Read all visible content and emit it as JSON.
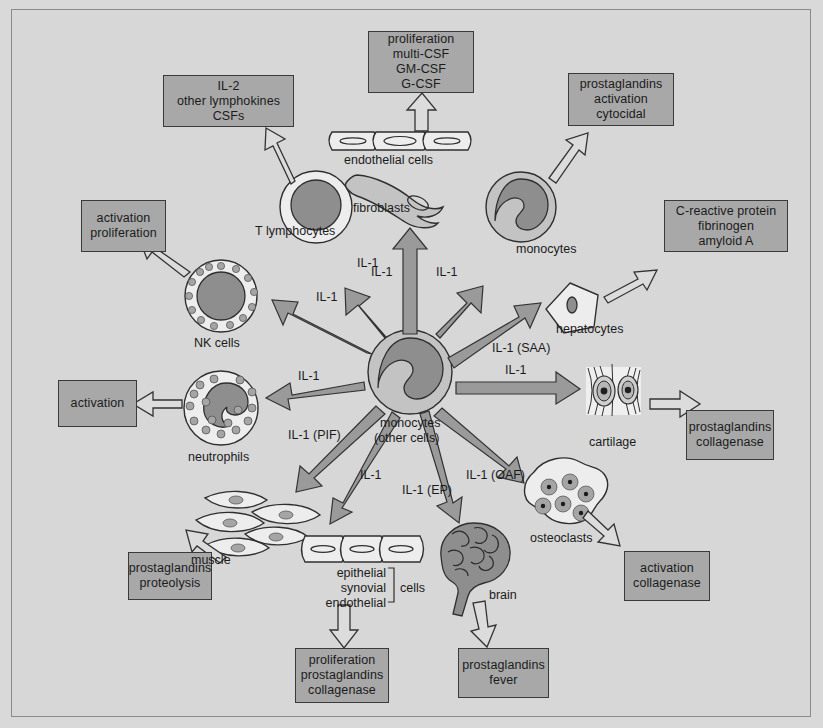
{
  "diagram": {
    "center": {
      "name": "monocytes-center",
      "label_line1": "monocytes",
      "label_line2": "(other cells)"
    },
    "colors": {
      "background": "#d7d7d7",
      "box_fill": "#a8a8a8",
      "box_border": "#3a3a3a",
      "solid_arrow": "#9a9a9a",
      "open_arrow": "#dcdcdc",
      "nucleus": "#8e8e8e",
      "cell_light": "#ededed",
      "text": "#1b1b1b"
    },
    "boxes": [
      {
        "name": "box-proliferation-csf",
        "lines": [
          "proliferation",
          "multi-CSF",
          "GM-CSF",
          "G-CSF"
        ]
      },
      {
        "name": "box-il2-lymphokines",
        "lines": [
          "IL-2",
          "other lymphokines",
          "CSFs"
        ]
      },
      {
        "name": "box-prostaglandins-activation-cytocidal",
        "lines": [
          "prostaglandins",
          "activation",
          "cytocidal"
        ]
      },
      {
        "name": "box-acute-phase-proteins",
        "lines": [
          "C-reactive protein",
          "fibrinogen",
          "amyloid A"
        ]
      },
      {
        "name": "box-activation-proliferation",
        "lines": [
          "activation",
          "proliferation"
        ]
      },
      {
        "name": "box-activation",
        "lines": [
          "activation"
        ]
      },
      {
        "name": "box-prostaglandins-proteolysis",
        "lines": [
          "prostaglandins",
          "proteolysis"
        ]
      },
      {
        "name": "box-proliferation-prostaglandins-collagenase",
        "lines": [
          "proliferation",
          "prostaglandins",
          "collagenase"
        ]
      },
      {
        "name": "box-prostaglandins-fever",
        "lines": [
          "prostaglandins",
          "fever"
        ]
      },
      {
        "name": "box-activation-collagenase",
        "lines": [
          "activation",
          "collagenase"
        ]
      },
      {
        "name": "box-prostaglandins-collagenase",
        "lines": [
          "prostaglandins",
          "collagenase"
        ]
      }
    ],
    "cells": [
      {
        "name": "cell-label-endothelial-cells",
        "label": "endothelial cells"
      },
      {
        "name": "cell-label-fibroblasts",
        "label": "fibroblasts"
      },
      {
        "name": "cell-label-t-lymphocytes",
        "label": "T lymphocytes"
      },
      {
        "name": "cell-label-monocytes",
        "label": "monocytes"
      },
      {
        "name": "cell-label-hepatocytes",
        "label": "hepatocytes"
      },
      {
        "name": "cell-label-nk-cells",
        "label": "NK cells"
      },
      {
        "name": "cell-label-neutrophils",
        "label": "neutrophils"
      },
      {
        "name": "cell-label-muscle",
        "label": "muscle"
      },
      {
        "name": "cell-label-cartilage",
        "label": "cartilage"
      },
      {
        "name": "cell-label-osteoclasts",
        "label": "osteoclasts"
      },
      {
        "name": "cell-label-brain",
        "label": "brain"
      },
      {
        "name": "cell-label-epithelial",
        "label": "epithelial"
      },
      {
        "name": "cell-label-synovial",
        "label": "synovial"
      },
      {
        "name": "cell-label-endothelial",
        "label": "endothelial"
      },
      {
        "name": "cell-label-cells-bracket",
        "label": "cells"
      }
    ],
    "arrow_labels": [
      {
        "name": "arrow-label-il1-tlymphocytes",
        "text": "IL-1"
      },
      {
        "name": "arrow-label-il1-fibroblasts",
        "text": "IL-1"
      },
      {
        "name": "arrow-label-il1-monocytes",
        "text": "IL-1"
      },
      {
        "name": "arrow-label-il1-nkcells",
        "text": "IL-1"
      },
      {
        "name": "arrow-label-il1-neutrophils",
        "text": "IL-1"
      },
      {
        "name": "arrow-label-il1-saa",
        "text": "IL-1 (SAA)"
      },
      {
        "name": "arrow-label-il1-cartilage",
        "text": "IL-1"
      },
      {
        "name": "arrow-label-il1-pif",
        "text": "IL-1 (PIF)"
      },
      {
        "name": "arrow-label-il1-epithelial",
        "text": "IL-1"
      },
      {
        "name": "arrow-label-il1-ep",
        "text": "IL-1 (EP)"
      },
      {
        "name": "arrow-label-il1-oaf",
        "text": "IL-1 (OAF)"
      }
    ]
  }
}
